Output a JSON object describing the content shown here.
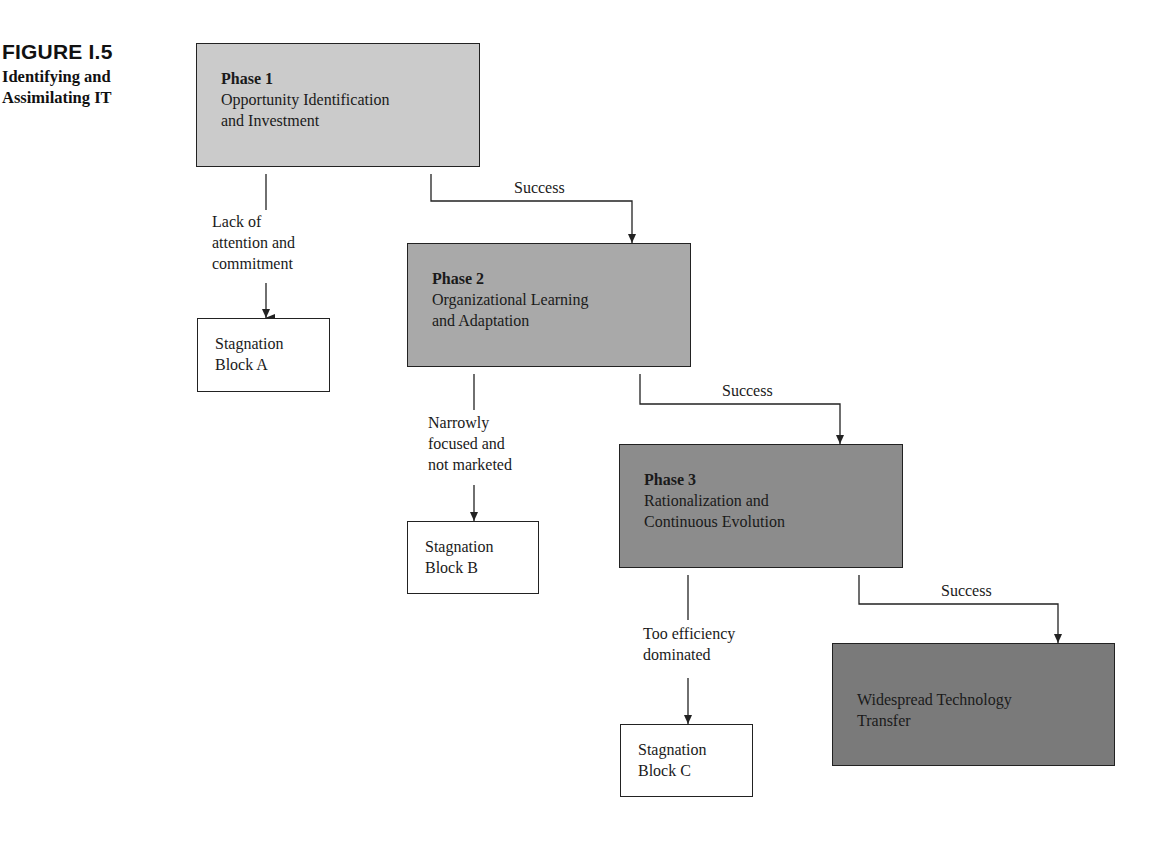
{
  "figure": {
    "number": "FIGURE I.5",
    "title_line1": "Identifying and",
    "title_line2": "Assimilating IT"
  },
  "phases": [
    {
      "heading": "Phase 1",
      "line1": "Opportunity Identification",
      "line2": "and Investment",
      "fill": "#cbcbcb"
    },
    {
      "heading": "Phase 2",
      "line1": "Organizational Learning",
      "line2": "and Adaptation",
      "fill": "#a9a9a9"
    },
    {
      "heading": "Phase 3",
      "line1": "Rationalization and",
      "line2": "Continuous Evolution",
      "fill": "#8c8c8c"
    }
  ],
  "final": {
    "line1": "Widespread Technology",
    "line2": "Transfer",
    "fill": "#7a7a7a"
  },
  "stagnation": [
    {
      "line1": "Stagnation",
      "line2": "Block A"
    },
    {
      "line1": "Stagnation",
      "line2": "Block B"
    },
    {
      "line1": "Stagnation",
      "line2": "Block C"
    }
  ],
  "failure_labels": [
    {
      "line1": "Lack of",
      "line2": "attention and",
      "line3": "commitment"
    },
    {
      "line1": "Narrowly",
      "line2": "focused and",
      "line3": "not marketed"
    },
    {
      "line1": "Too efficiency",
      "line2": "dominated"
    }
  ],
  "success_labels": [
    "Success",
    "Success",
    "Success"
  ]
}
